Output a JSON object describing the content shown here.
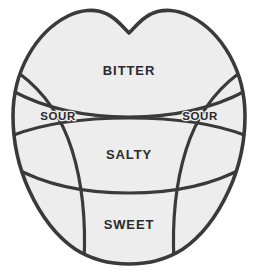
{
  "diagram": {
    "type": "tongue-taste-map",
    "colors": {
      "background": "#ffffff",
      "fill": "#ededed",
      "stroke": "#3a3a3a",
      "label_text": "#2b2b2b"
    },
    "regions": [
      {
        "id": "bitter",
        "label": "BITTER",
        "position": "back-center",
        "label_x": 129,
        "label_y": 72
      },
      {
        "id": "sour-left",
        "label": "SOUR",
        "position": "left-side",
        "label_x": 58,
        "label_y": 117
      },
      {
        "id": "sour-right",
        "label": "SOUR",
        "position": "right-side",
        "label_x": 200,
        "label_y": 117
      },
      {
        "id": "salty",
        "label": "SALTY",
        "position": "center",
        "label_x": 129,
        "label_y": 156
      },
      {
        "id": "sweet",
        "label": "SWEET",
        "position": "tip-front",
        "label_x": 129,
        "label_y": 226
      }
    ]
  }
}
